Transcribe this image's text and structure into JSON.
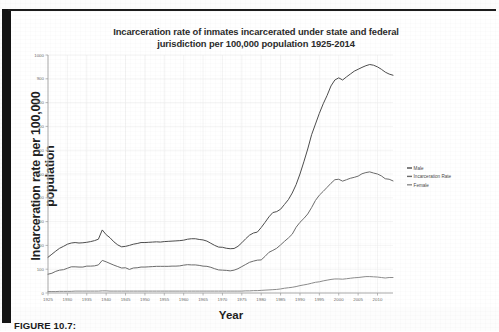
{
  "figure": {
    "caption": "FIGURE 10.7:"
  },
  "chart_data": {
    "type": "line",
    "title": "Incarceration rate of inmates incarcerated under state and federal jurisdiction per 100,000 population 1925-2014",
    "title_line1": "Incarceration rate of inmates incarcerated under state and federal",
    "title_line2": "jurisdiction per 100,000 population 1925-2014",
    "xlabel": "Year",
    "ylabel": "Incarceration rate per 100,000 population",
    "xlim": [
      1925,
      2014
    ],
    "ylim": [
      0,
      1000
    ],
    "grid": true,
    "legend_position": "right",
    "xticks": [
      1925,
      1930,
      1935,
      1940,
      1945,
      1950,
      1955,
      1960,
      1965,
      1970,
      1975,
      1980,
      1985,
      1990,
      1995,
      2000,
      2005,
      2010
    ],
    "xtick_labels": [
      "1925",
      "1930",
      "1935",
      "1940",
      "1945",
      "1950",
      "1955",
      "1960",
      "1965",
      "1970",
      "1975",
      "1980",
      "1985",
      "1990",
      "1995",
      "2000",
      "2005",
      "2010"
    ],
    "yticks": [
      0,
      100,
      200,
      300,
      400,
      500,
      600,
      700,
      800,
      900,
      1000
    ],
    "ytick_labels": [
      "0",
      "100",
      "200",
      "300",
      "400",
      "500",
      "600",
      "700",
      "800",
      "900",
      "1000"
    ],
    "x": [
      1925,
      1926,
      1927,
      1928,
      1929,
      1930,
      1931,
      1932,
      1933,
      1934,
      1935,
      1936,
      1937,
      1938,
      1939,
      1940,
      1941,
      1942,
      1943,
      1944,
      1945,
      1946,
      1947,
      1948,
      1949,
      1950,
      1951,
      1952,
      1953,
      1954,
      1955,
      1956,
      1957,
      1958,
      1959,
      1960,
      1961,
      1962,
      1963,
      1964,
      1965,
      1966,
      1967,
      1968,
      1969,
      1970,
      1971,
      1972,
      1973,
      1974,
      1975,
      1976,
      1977,
      1978,
      1979,
      1980,
      1981,
      1982,
      1983,
      1984,
      1985,
      1986,
      1987,
      1988,
      1989,
      1990,
      1991,
      1992,
      1993,
      1994,
      1995,
      1996,
      1997,
      1998,
      1999,
      2000,
      2001,
      2002,
      2003,
      2004,
      2005,
      2006,
      2007,
      2008,
      2009,
      2010,
      2011,
      2012,
      2013,
      2014
    ],
    "series": [
      {
        "name": "Male",
        "color": "#4d4d4d",
        "values": [
          150,
          163,
          176,
          188,
          196,
          205,
          210,
          212,
          210,
          211,
          213,
          216,
          220,
          226,
          265,
          245,
          232,
          215,
          202,
          194,
          196,
          200,
          205,
          208,
          212,
          212,
          213,
          214,
          215,
          214,
          216,
          217,
          218,
          219,
          220,
          222,
          226,
          228,
          228,
          225,
          223,
          218,
          209,
          200,
          193,
          192,
          188,
          186,
          187,
          196,
          211,
          228,
          243,
          252,
          256,
          275,
          297,
          320,
          338,
          342,
          352,
          372,
          392,
          420,
          455,
          500,
          551,
          605,
          665,
          710,
          755,
          795,
          830,
          870,
          895,
          904,
          895,
          908,
          920,
          932,
          940,
          948,
          955,
          960,
          957,
          950,
          940,
          928,
          920,
          915
        ]
      },
      {
        "name": "Incarceration Rate",
        "color": "#6b6b6b",
        "values": [
          79,
          83,
          91,
          96,
          98,
          104,
          110,
          110,
          109,
          109,
          113,
          113,
          114,
          118,
          137,
          131,
          124,
          117,
          111,
          105,
          106,
          99,
          105,
          106,
          109,
          109,
          110,
          111,
          112,
          112,
          112,
          112,
          113,
          113,
          114,
          117,
          119,
          118,
          118,
          116,
          113,
          112,
          108,
          102,
          97,
          96,
          95,
          93,
          96,
          102,
          111,
          120,
          129,
          134,
          138,
          139,
          154,
          171,
          179,
          188,
          202,
          217,
          231,
          247,
          276,
          297,
          313,
          332,
          359,
          389,
          411,
          427,
          444,
          461,
          476,
          478,
          470,
          476,
          482,
          486,
          491,
          501,
          506,
          509,
          504,
          500,
          492,
          480,
          478,
          471
        ]
      },
      {
        "name": "Female",
        "color": "#8c8c8c",
        "values": [
          6,
          6,
          6,
          7,
          7,
          7,
          7,
          8,
          8,
          8,
          8,
          8,
          8,
          8,
          9,
          9,
          8,
          8,
          8,
          8,
          8,
          8,
          8,
          8,
          8,
          8,
          8,
          8,
          8,
          8,
          8,
          8,
          8,
          8,
          8,
          8,
          8,
          8,
          8,
          8,
          8,
          8,
          8,
          8,
          8,
          8,
          8,
          8,
          8,
          8,
          8,
          9,
          9,
          10,
          10,
          11,
          12,
          13,
          14,
          15,
          17,
          20,
          22,
          24,
          27,
          31,
          34,
          37,
          41,
          45,
          47,
          51,
          54,
          57,
          59,
          59,
          58,
          60,
          62,
          64,
          65,
          67,
          69,
          69,
          68,
          67,
          65,
          63,
          65,
          65
        ]
      }
    ]
  }
}
